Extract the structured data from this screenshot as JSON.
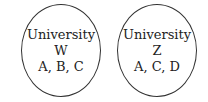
{
  "diagram": {
    "circles": [
      {
        "title": "University",
        "name": "W",
        "members": "A, B, C"
      },
      {
        "title": "University",
        "name": "Z",
        "members": "A, C, D"
      }
    ]
  }
}
